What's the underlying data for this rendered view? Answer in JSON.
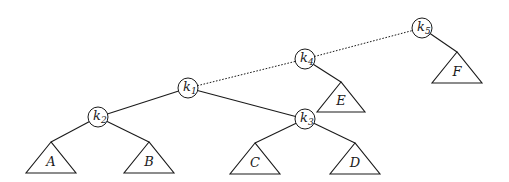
{
  "diagram": {
    "type": "tree",
    "nodes": [
      {
        "id": "k1",
        "letter": "k",
        "sub": "1",
        "x": 188,
        "y": 88
      },
      {
        "id": "k2",
        "letter": "k",
        "sub": "2",
        "x": 98,
        "y": 117
      },
      {
        "id": "k3",
        "letter": "k",
        "sub": "3",
        "x": 305,
        "y": 119
      },
      {
        "id": "k4",
        "letter": "k",
        "sub": "4",
        "x": 305,
        "y": 59
      },
      {
        "id": "k5",
        "letter": "k",
        "sub": "5",
        "x": 422,
        "y": 28
      }
    ],
    "subtrees": [
      {
        "id": "A",
        "label": "A",
        "apex": [
          51,
          142
        ],
        "base_y": 173,
        "half_width": 25
      },
      {
        "id": "B",
        "label": "B",
        "apex": [
          149,
          142
        ],
        "base_y": 173,
        "half_width": 25
      },
      {
        "id": "C",
        "label": "C",
        "apex": [
          255,
          143
        ],
        "base_y": 174,
        "half_width": 25
      },
      {
        "id": "D",
        "label": "D",
        "apex": [
          355,
          143
        ],
        "base_y": 174,
        "half_width": 25
      },
      {
        "id": "E",
        "label": "E",
        "apex": [
          341,
          82
        ],
        "base_y": 112,
        "half_width": 24
      },
      {
        "id": "F",
        "label": "F",
        "apex": [
          457,
          52
        ],
        "base_y": 83,
        "half_width": 25
      }
    ],
    "edges": [
      {
        "from": "k1",
        "to": "k2",
        "style": "solid"
      },
      {
        "from": "k1",
        "to": "k3",
        "style": "solid"
      },
      {
        "from": "k1",
        "to": "k4",
        "style": "dotted"
      },
      {
        "from": "k4",
        "to": "k5",
        "style": "dotted"
      },
      {
        "from": "k2",
        "to": "A",
        "style": "solid"
      },
      {
        "from": "k2",
        "to": "B",
        "style": "solid"
      },
      {
        "from": "k3",
        "to": "C",
        "style": "solid"
      },
      {
        "from": "k3",
        "to": "D",
        "style": "solid"
      },
      {
        "from": "k4",
        "to": "E",
        "style": "solid"
      },
      {
        "from": "k5",
        "to": "F",
        "style": "solid"
      }
    ],
    "node_radius": 10
  }
}
